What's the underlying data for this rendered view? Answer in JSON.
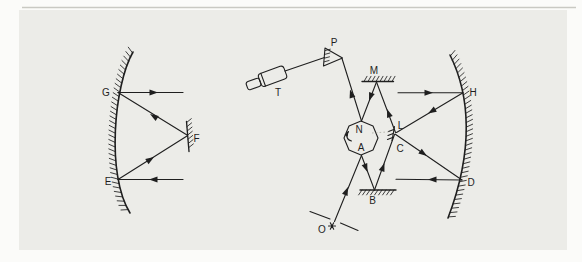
{
  "figure": {
    "colors": {
      "ink": "#1f1f1f",
      "page_bg": "#fbfbf9",
      "panel_bg": "#ecece8",
      "panel_edge": "#c9c9c3",
      "faint_dash": "#a9a9a1"
    },
    "icons": {
      "source_star": "asterisk-star",
      "rotation_arrow": "curved-rotation-arrow"
    }
  },
  "labels": {
    "G": "G",
    "F": "F",
    "E": "E",
    "T": "T",
    "P": "P",
    "M": "M",
    "N": "N",
    "A": "A",
    "B": "B",
    "L": "L",
    "C": "C",
    "H": "H",
    "D": "D",
    "O": "O"
  }
}
